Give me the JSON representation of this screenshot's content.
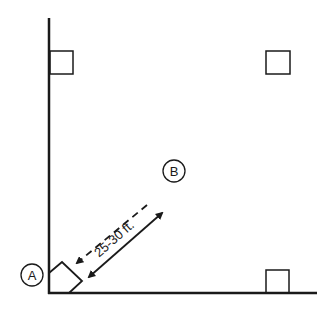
{
  "diagram": {
    "point_a_label": "A",
    "point_b_label": "B",
    "distance_label": "25-30 ft.",
    "colors": {
      "stroke": "#1a1a1a",
      "background": "#ffffff"
    }
  }
}
